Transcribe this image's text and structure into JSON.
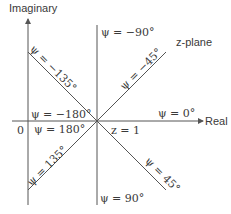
{
  "diagram": {
    "title": "z-plane",
    "axes": {
      "vertical_label": "Imaginary",
      "horizontal_label": "Real",
      "origin_label": "0",
      "center_label": "z = 1"
    },
    "rays": [
      {
        "angle": "ψ = 0°",
        "direction": "east"
      },
      {
        "angle": "ψ = −45°",
        "direction": "north-east"
      },
      {
        "angle": "ψ = −90°",
        "direction": "north"
      },
      {
        "angle": "ψ = −135°",
        "direction": "north-west"
      },
      {
        "angle": "ψ = −180°",
        "direction": "west-upper"
      },
      {
        "angle": "ψ = 180°",
        "direction": "west-lower"
      },
      {
        "angle": "ψ = 135°",
        "direction": "south-west"
      },
      {
        "angle": "ψ = 90°",
        "direction": "south"
      },
      {
        "angle": "ψ = 45°",
        "direction": "south-east"
      }
    ],
    "colors": {
      "line": "#555555",
      "text": "#3a3a3a",
      "background": "#ffffff"
    }
  }
}
